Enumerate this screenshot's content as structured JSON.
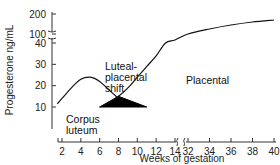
{
  "chart_data": {
    "type": "line",
    "title": "",
    "xlabel": "Weeks of gestation",
    "ylabel": "Progesterone ng/mL",
    "x_ticks": [
      2,
      4,
      6,
      8,
      10,
      12,
      14,
      32,
      34,
      36,
      38,
      40
    ],
    "x_break": [
      14,
      32
    ],
    "y_ticks": [
      10,
      20,
      30,
      40,
      100,
      200
    ],
    "y_break": [
      40,
      100
    ],
    "grid": false,
    "series": [
      {
        "name": "Corpus luteum",
        "x": [
          1.5,
          2,
          3,
          4,
          5,
          6,
          7,
          8,
          9,
          10,
          11
        ],
        "y": [
          11.5,
          14,
          19,
          23,
          24,
          22,
          18,
          14,
          11,
          9.5,
          9
        ]
      },
      {
        "name": "Placental",
        "x": [
          6,
          7,
          8,
          9,
          10,
          11,
          12,
          13,
          14,
          32,
          34,
          36,
          38,
          40
        ],
        "y": [
          10,
          12,
          15,
          19,
          24,
          29,
          34,
          40,
          60,
          100,
          125,
          145,
          160,
          170
        ]
      },
      {
        "name": "Luteal-placental shift (shaded)",
        "x": [
          6,
          8,
          11
        ],
        "y": [
          10,
          15,
          10
        ]
      }
    ],
    "annotations": [
      {
        "text": "Corpus",
        "x": 5.5,
        "y": 12
      },
      {
        "text": "luteum",
        "x": 5.5,
        "y": 8
      },
      {
        "text": "Luteal-",
        "x": 9,
        "y": 38
      },
      {
        "text": "placental",
        "x": 9,
        "y": 32
      },
      {
        "text": "shift",
        "x": 9,
        "y": 26
      },
      {
        "text": "Placental",
        "x": 34,
        "y": 40
      }
    ]
  }
}
